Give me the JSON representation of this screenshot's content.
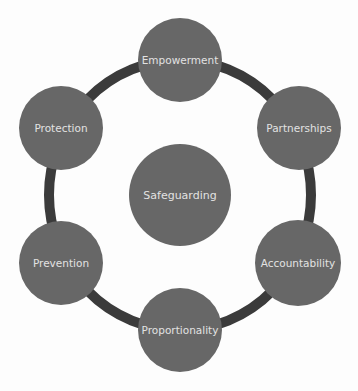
{
  "diagram": {
    "type": "cycle",
    "colors": {
      "background": "#fdfdfd",
      "ring": "#3b3b3b",
      "node_fill": "#676767",
      "label": "#e2e2e2"
    },
    "ring": {
      "cx": 180,
      "cy": 195,
      "rx": 131,
      "ry": 135,
      "stroke_width": 10
    },
    "center": {
      "label": "Safeguarding",
      "cx": 180,
      "cy": 195,
      "r": 51
    },
    "nodes": [
      {
        "label": "Empowerment",
        "cx": 180,
        "cy": 60,
        "r": 42
      },
      {
        "label": "Partnerships",
        "cx": 299,
        "cy": 128,
        "r": 42
      },
      {
        "label": "Accountability",
        "cx": 298,
        "cy": 263,
        "r": 43
      },
      {
        "label": "Proportionality",
        "cx": 180,
        "cy": 330,
        "r": 42
      },
      {
        "label": "Prevention",
        "cx": 61,
        "cy": 263,
        "r": 42
      },
      {
        "label": "Protection",
        "cx": 61,
        "cy": 128,
        "r": 42
      }
    ]
  }
}
